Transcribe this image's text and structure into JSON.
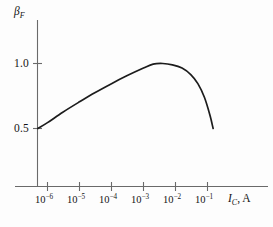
{
  "chart_data": {
    "type": "line",
    "title": "",
    "xlabel": "I_C, A",
    "xlabel_symbol": "I",
    "xlabel_subscript": "C",
    "xlabel_unit": ", A",
    "ylabel": "β_F",
    "ylabel_symbol": "β",
    "ylabel_subscript": "F",
    "xscale": "log",
    "xlim": [
      3.2e-07,
      1.0
    ],
    "ylim": [
      0.0,
      1.22
    ],
    "grid": false,
    "legend": null,
    "x_tick_labels": [
      "10-6",
      "10-5",
      "10-4",
      "10-3",
      "10-2",
      "10-1"
    ],
    "x_tick_mantissa": [
      "10",
      "10",
      "10",
      "10",
      "10",
      "10"
    ],
    "x_tick_exponents": [
      "−6",
      "−5",
      "−4",
      "−3",
      "−2",
      "−1"
    ],
    "x_tick_values": [
      1e-06,
      1e-05,
      0.0001,
      0.001,
      0.01,
      0.1
    ],
    "y_tick_labels": [
      "1.0",
      "0.5"
    ],
    "y_tick_values": [
      1.0,
      0.5
    ],
    "series": [
      {
        "name": "beta_F",
        "x": [
          5e-07,
          1e-06,
          3e-06,
          1e-05,
          3e-05,
          0.0001,
          0.0003,
          0.001,
          0.002,
          0.004,
          0.008,
          0.016,
          0.03,
          0.05,
          0.08,
          0.12,
          0.15
        ],
        "y": [
          0.5,
          0.545,
          0.625,
          0.705,
          0.775,
          0.845,
          0.905,
          0.965,
          0.995,
          1.0,
          0.99,
          0.965,
          0.915,
          0.845,
          0.74,
          0.6,
          0.5
        ]
      }
    ],
    "annotations": [],
    "colors": {
      "curve": "#1c1c1c",
      "axis": "#6a6a6a",
      "text": "#141414",
      "background": "#fdfdfd"
    }
  }
}
